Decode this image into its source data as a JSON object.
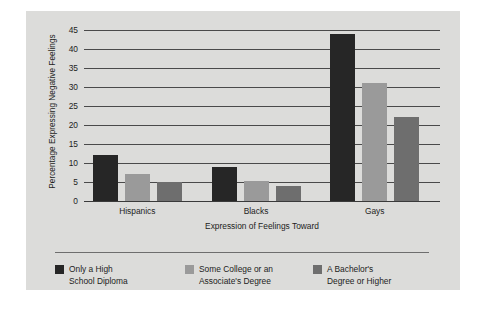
{
  "chart_data": {
    "type": "bar",
    "title": "",
    "xlabel": "Expression of Feelings Toward",
    "ylabel": "Percentage Expressing Negative Feelings",
    "categories": [
      "Hispanics",
      "Blacks",
      "Gays"
    ],
    "series": [
      {
        "name": "Only a High\nSchool Diploma",
        "color": "#262626",
        "values": [
          12,
          9,
          44
        ]
      },
      {
        "name": "Some College or an\nAssociate's Degree",
        "color": "#9a9a9a",
        "values": [
          7,
          5.3,
          31
        ]
      },
      {
        "name": "A Bachelor's\nDegree or Higher",
        "color": "#6e6e6e",
        "values": [
          5,
          4,
          22
        ]
      }
    ],
    "ylim": [
      0,
      45
    ],
    "yticks": [
      "0",
      "5",
      "10",
      "15",
      "20",
      "25",
      "30",
      "35",
      "40",
      "45"
    ],
    "ytick_values": [
      0,
      5,
      10,
      15,
      20,
      25,
      30,
      35,
      40,
      45
    ],
    "grid": true,
    "legend_position": "bottom",
    "background": "#dcdcda",
    "gridline_color": "#4a4a4a"
  }
}
